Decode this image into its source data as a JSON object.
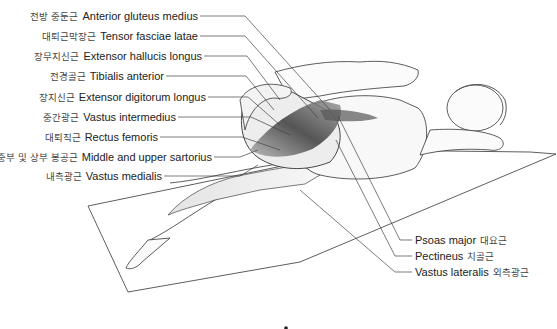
{
  "figure": {
    "title": "",
    "left_labels": [
      {
        "ko": "전방 중둔근",
        "en": "Anterior gluteus medius"
      },
      {
        "ko": "대퇴근막장근",
        "en": "Tensor fasciae latae"
      },
      {
        "ko": "장무지신근",
        "en": "Extensor hallucis longus"
      },
      {
        "ko": "전경골근",
        "en": "Tibialis anterior"
      },
      {
        "ko": "장지신근",
        "en": "Extensor digitorum longus"
      },
      {
        "ko": "중간광근",
        "en": "Vastus intermedius"
      },
      {
        "ko": "대퇴직근",
        "en": "Rectus femoris"
      },
      {
        "ko": "중부 및 상부 봉공근",
        "en": "Middle and upper sartorius"
      },
      {
        "ko": "내측광근",
        "en": "Vastus medialis"
      }
    ],
    "right_labels": [
      {
        "en": "Psoas major",
        "ko": "대요근"
      },
      {
        "en": "Pectineus",
        "ko": "치골근"
      },
      {
        "en": "Vastus lateralis",
        "ko": "외측광근"
      }
    ],
    "colors": {
      "line": "#333333",
      "muscle_dark": "#3a3a3a",
      "muscle_mid": "#8a8a8a",
      "text": "#222222"
    }
  }
}
